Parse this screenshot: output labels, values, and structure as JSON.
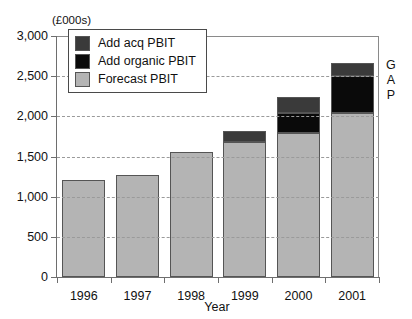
{
  "title": "",
  "unit_caption": "(£000s)",
  "annotation": {
    "gap_letters": [
      "G",
      "A",
      "P"
    ]
  },
  "legend": {
    "position": "top-left-inside",
    "items": [
      {
        "label": "Add acq PBIT",
        "color": "#3a3a3a"
      },
      {
        "label": "Add organic PBIT",
        "color": "#0a0a0a"
      },
      {
        "label": "Forecast PBIT",
        "color": "#b4b4b4"
      }
    ]
  },
  "chart_data": {
    "type": "bar",
    "subtype": "stacked",
    "title": "",
    "xlabel": "Year",
    "ylabel": "(£000s)",
    "ylim": [
      0,
      3000
    ],
    "ytick_labels": [
      "0",
      "500",
      "1,000",
      "1,500",
      "2,000",
      "2,500",
      "3,000"
    ],
    "ytick_values": [
      0,
      500,
      1000,
      1500,
      2000,
      2500,
      3000
    ],
    "grid": true,
    "grid_axis": "y",
    "categories": [
      "1996",
      "1997",
      "1998",
      "1999",
      "2000",
      "2001"
    ],
    "series": [
      {
        "name": "Forecast PBIT",
        "color": "#b4b4b4",
        "values": [
          1210,
          1275,
          1560,
          1675,
          1790,
          2040
        ]
      },
      {
        "name": "Add organic PBIT",
        "color": "#0a0a0a",
        "values": [
          0,
          0,
          0,
          0,
          255,
          460
        ]
      },
      {
        "name": "Add acq PBIT",
        "color": "#3a3a3a",
        "values": [
          0,
          0,
          0,
          145,
          195,
          160
        ]
      }
    ],
    "totals": [
      1210,
      1275,
      1560,
      1820,
      2240,
      2660
    ]
  }
}
